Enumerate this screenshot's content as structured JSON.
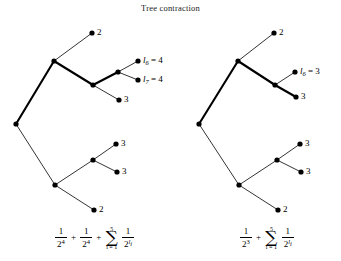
{
  "figure": {
    "title": "Tree contraction",
    "background_color": "#ffffff",
    "ink_color": "#000000",
    "width": 341,
    "height": 261
  },
  "left_tree": {
    "name": "before-contraction",
    "labels": {
      "leaf_top": "2",
      "leaf_l6": "l₆ = 4",
      "leaf_l6_symbol": "l",
      "leaf_l6_sub": "6",
      "leaf_l6_value": "= 4",
      "leaf_l7_symbol": "l",
      "leaf_l7_sub": "7",
      "leaf_l7_value": "= 4",
      "leaf_mid3": "3",
      "leaf_lower3a": "3",
      "leaf_lower3b": "3",
      "leaf_bottom2": "2"
    },
    "formula": {
      "term1_num": "1",
      "term1_den": "2",
      "term1_exp": "4",
      "plus1": "+",
      "term2_num": "1",
      "term2_den": "2",
      "term2_exp": "4",
      "plus2": "+",
      "sum_upper": "5",
      "sum_lower": "i = 1",
      "sum_symbol": "∑",
      "sum_num": "1",
      "sum_den": "2",
      "sum_exp_symbol": "l",
      "sum_exp_sub": "i"
    }
  },
  "right_tree": {
    "name": "after-contraction",
    "labels": {
      "leaf_top": "2",
      "leaf_l6_symbol": "l",
      "leaf_l6_sub": "6",
      "leaf_l6_value": "= 3",
      "leaf_mid3": "3",
      "leaf_lower3a": "3",
      "leaf_lower3b": "3",
      "leaf_bottom2": "2"
    },
    "formula": {
      "term1_num": "1",
      "term1_den": "2",
      "term1_exp": "3",
      "plus1": "+",
      "sum_upper": "5",
      "sum_lower": "i = 1",
      "sum_symbol": "∑",
      "sum_num": "1",
      "sum_den": "2",
      "sum_exp_symbol": "l",
      "sum_exp_sub": "i"
    }
  }
}
